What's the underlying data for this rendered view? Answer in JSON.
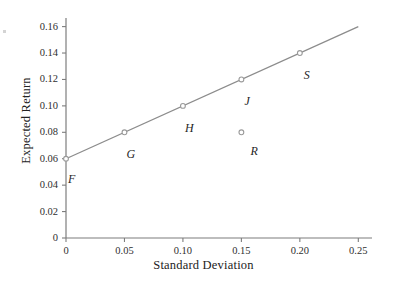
{
  "chart_data": {
    "type": "scatter",
    "title": "",
    "xlabel": "Standard Deviation",
    "ylabel": "Expected Return",
    "xlim": [
      0,
      0.26
    ],
    "ylim": [
      0,
      0.165
    ],
    "grid": false,
    "legend": null,
    "x_ticks": [
      "0",
      "0.05",
      "0.10",
      "0.15",
      "0.20",
      "0.25"
    ],
    "x_tick_values": [
      0,
      0.05,
      0.1,
      0.15,
      0.2,
      0.25
    ],
    "y_ticks": [
      "0",
      "0.02",
      "0.04",
      "0.06",
      "0.08",
      "0.10",
      "0.12",
      "0.14",
      "0.16"
    ],
    "y_tick_values": [
      0,
      0.02,
      0.04,
      0.06,
      0.08,
      0.1,
      0.12,
      0.14,
      0.16
    ],
    "series": [
      {
        "name": "Capital Allocation Line",
        "type": "line",
        "x": [
          0,
          0.25
        ],
        "y": [
          0.06,
          0.16
        ],
        "color": "#8c8c8c"
      },
      {
        "name": "Portfolios",
        "type": "scatter",
        "marker": "open-circle",
        "color": "#8c8c8c",
        "points": [
          {
            "label": "F",
            "x": 0,
            "y": 0.06,
            "label_dx": 2,
            "label_dy": 14,
            "on_line": true
          },
          {
            "label": "G",
            "x": 0.05,
            "y": 0.08,
            "label_dx": 2,
            "label_dy": 16,
            "on_line": true
          },
          {
            "label": "H",
            "x": 0.1,
            "y": 0.1,
            "label_dx": 2,
            "label_dy": 16,
            "on_line": true
          },
          {
            "label": "J",
            "x": 0.15,
            "y": 0.12,
            "label_dx": 3,
            "label_dy": 16,
            "on_line": true
          },
          {
            "label": "S",
            "x": 0.2,
            "y": 0.14,
            "label_dx": 4,
            "label_dy": 16,
            "on_line": true
          },
          {
            "label": "R",
            "x": 0.15,
            "y": 0.08,
            "label_dx": 9,
            "label_dy": 13,
            "on_line": false
          }
        ]
      }
    ],
    "axis_color": "#7d7d7d",
    "line_color": "#8c8c8c",
    "marker_edge_color": "#9a9a9a",
    "marker_fill_color": "#ffffff",
    "background_color": "#ffffff"
  },
  "geometry": {
    "plot_left": 66,
    "plot_right": 370,
    "plot_bottom": 238,
    "plot_top": 20,
    "x_axis_end": 372,
    "y_axis_top": 18
  }
}
